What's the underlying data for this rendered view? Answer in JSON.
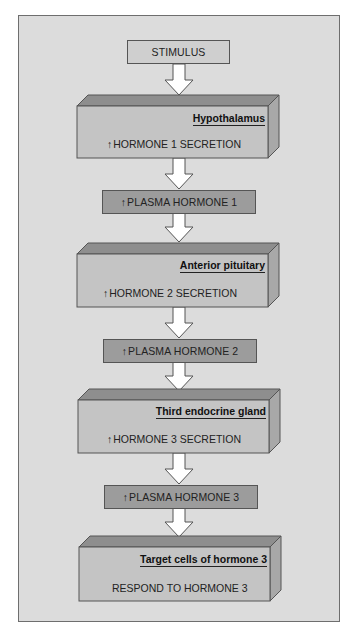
{
  "diagram": {
    "stimulus": "STIMULUS",
    "up_symbol": "↑",
    "stages": [
      {
        "title": "Hypothalamus",
        "text": "HORMONE 1 SECRETION",
        "has_up": true
      },
      {
        "title": "Anterior pituitary",
        "text": "HORMONE 2 SECRETION",
        "has_up": true
      },
      {
        "title": "Third endocrine gland",
        "text": "HORMONE 3 SECRETION",
        "has_up": true
      },
      {
        "title": "Target cells of hormone 3",
        "text": "RESPOND TO HORMONE 3",
        "has_up": false
      }
    ],
    "plasma": [
      "PLASMA HORMONE 1",
      "PLASMA HORMONE 2",
      "PLASMA HORMONE 3"
    ],
    "colors": {
      "panel": "#dcdcdc",
      "box_front": "#c4c4c4",
      "box_top": "#8e8e8e",
      "box_side": "#a8a8a8",
      "plasma": "#9c9c9c",
      "stimulus": "#cfcfcf"
    }
  }
}
